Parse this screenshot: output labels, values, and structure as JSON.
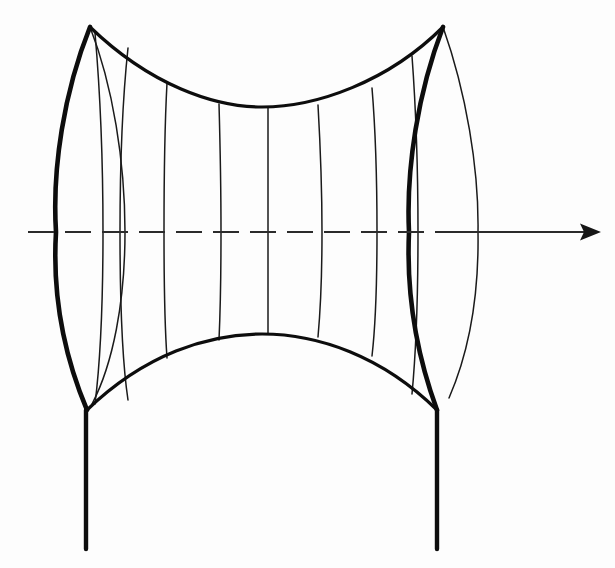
{
  "figure": {
    "title": "Surface of revolution with vertical supports and central axis",
    "kind": "line-diagram",
    "background_color": "#fdfdfd",
    "ink_color": "#0d0d0d",
    "canvas": {
      "width": 615,
      "height": 568
    }
  },
  "axis": {
    "name": "axis-of-revolution",
    "y": 232,
    "dashed_start_x": 28,
    "dashed_end_x": 455,
    "solid_end_x": 592,
    "arrow_tip_x": 601,
    "dash_pattern": "26 11",
    "arrow_label": ""
  },
  "geometry": {
    "left_cusp_top": {
      "x": 90,
      "y": 27
    },
    "right_cusp_top": {
      "x": 443,
      "y": 27
    },
    "left_cusp_bottom": {
      "x": 87,
      "y": 410
    },
    "right_cusp_bottom": {
      "x": 437,
      "y": 410
    },
    "top_rim_sag_y": 107,
    "bottom_rim_crest_y": 334,
    "left_silhouette_x": 56,
    "right_silhouette_x": 479,
    "waist_center_x": 262,
    "leg_bottom_y": 549
  },
  "paths": {
    "left_outer_edge": "M 90 27 C 64 92 52 168 56 232 C 52 299 66 360 87 410",
    "right_inner_edge": "M 443 27 C 418 92 406 168 409 232 C 406 299 419 361 437 410",
    "right_outer_edge": "M 443 27 C 466 92 479 168 478 232 C 479 296 469 352 449 398",
    "left_far_edge": "M 90 27 C 113 86 125 162 125 232 C 125 302 113 364 92 404",
    "top_rim": "M 90 27 C 150 85 214 107 262 107 C 316 107 388 82 443 27",
    "bottom_rim": "M 87 410 C 145 354 208 334 262 334 C 318 334 382 356 437 410",
    "left_rim_back": "M 90 30 C 70 92 60 168 63 232 C 60 299 72 360 89 406",
    "legs": [
      {
        "name": "left-support-leg",
        "x": 86,
        "y1": 410,
        "y2": 549
      },
      {
        "name": "right-support-leg",
        "x": 437,
        "y1": 410,
        "y2": 549
      }
    ],
    "meridians": [
      "M 95 33 C 100 90 103 162 103 232 C 103 302 100 364 95 404",
      "M 128 48 C 122 104 120 168 120 232 C 120 298 122 360 128 400",
      "M 167 83 C 165 120 164 175 164 232 C 164 290 165 330 167 358",
      "M 219 104 C 220 140 221 185 221 232 C 221 280 220 318 219 340",
      "M 268 107 C 268 140 268 185 268 232 C 268 280 268 312 268 334",
      "M 318 105 C 320 140 322 185 322 232 C 322 280 320 315 318 337",
      "M 372 88 C 375 124 377 178 377 232 C 377 288 375 330 372 356",
      "M 412 56 C 416 110 418 170 418 232 C 418 296 416 352 412 394"
    ]
  },
  "strokes": {
    "heavy_width": 4.6,
    "medium_width": 3.2,
    "thin_width": 1.5,
    "leg_width": 4.4
  },
  "annotations": {
    "visible_text": [],
    "note": "No labels or text appear in the figure."
  }
}
